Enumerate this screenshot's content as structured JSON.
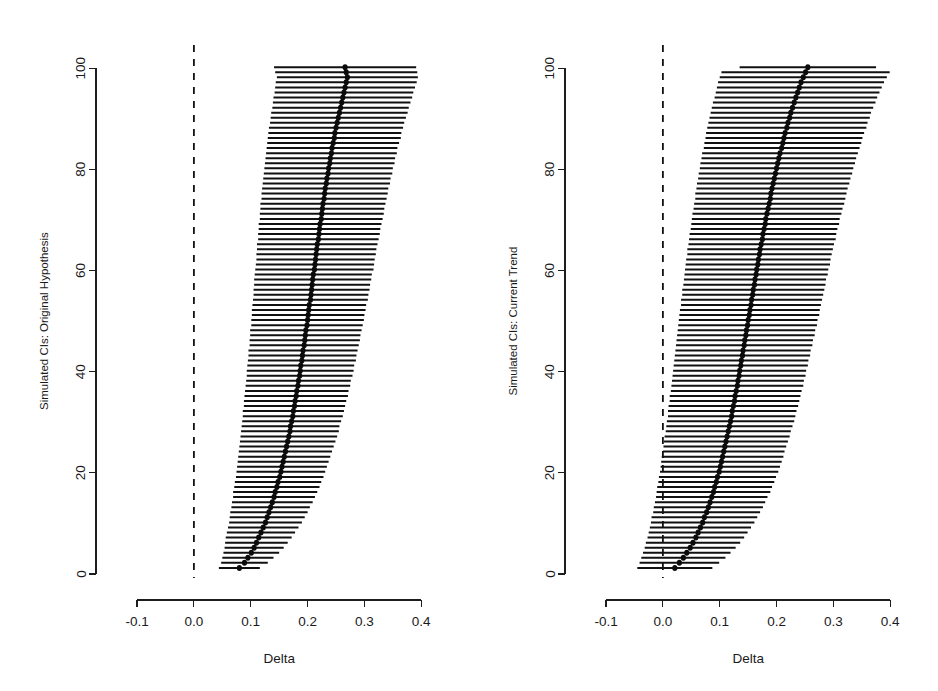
{
  "figure": {
    "background": "#ffffff",
    "ink": "#111111",
    "width": 938,
    "height": 691
  },
  "chart_data": [
    {
      "type": "line",
      "subtype": "forest-plot-simulated-confidence-intervals",
      "panel": "left",
      "title": "",
      "xlabel": "Delta",
      "ylabel": "Simulated CIs: Original Hypothesis",
      "xlim": [
        -0.13,
        0.44
      ],
      "ylim": [
        0,
        103
      ],
      "xticks": [
        -0.1,
        0.0,
        0.1,
        0.2,
        0.3,
        0.4
      ],
      "xticklabels": [
        "-0.1",
        "0.0",
        "0.1",
        "0.2",
        "0.3",
        "0.4"
      ],
      "yticks": [
        0,
        20,
        40,
        60,
        80,
        100
      ],
      "yticklabels": [
        "0",
        "20",
        "40",
        "60",
        "80",
        "100"
      ],
      "grid": false,
      "legend": null,
      "reference_line": {
        "x": 0.0,
        "style": "dashed",
        "color": "#111111"
      },
      "n_intervals": 100,
      "series": [
        {
          "name": "Simulated CI",
          "estimates": [
            0.08,
            0.089,
            0.095,
            0.101,
            0.106,
            0.11,
            0.114,
            0.118,
            0.122,
            0.126,
            0.129,
            0.132,
            0.135,
            0.138,
            0.141,
            0.143,
            0.146,
            0.148,
            0.151,
            0.153,
            0.155,
            0.157,
            0.159,
            0.161,
            0.163,
            0.165,
            0.167,
            0.169,
            0.17,
            0.172,
            0.174,
            0.175,
            0.177,
            0.178,
            0.18,
            0.181,
            0.183,
            0.184,
            0.186,
            0.187,
            0.188,
            0.19,
            0.191,
            0.192,
            0.194,
            0.195,
            0.196,
            0.197,
            0.199,
            0.2,
            0.201,
            0.202,
            0.203,
            0.205,
            0.206,
            0.207,
            0.208,
            0.209,
            0.21,
            0.212,
            0.213,
            0.214,
            0.215,
            0.216,
            0.217,
            0.219,
            0.22,
            0.221,
            0.222,
            0.224,
            0.225,
            0.226,
            0.227,
            0.229,
            0.23,
            0.231,
            0.233,
            0.234,
            0.236,
            0.237,
            0.239,
            0.24,
            0.242,
            0.243,
            0.245,
            0.247,
            0.248,
            0.25,
            0.252,
            0.254,
            0.256,
            0.258,
            0.26,
            0.262,
            0.264,
            0.266,
            0.268,
            0.27,
            0.268,
            0.266
          ],
          "half_widths": [
            0.036,
            0.041,
            0.045,
            0.049,
            0.052,
            0.055,
            0.058,
            0.06,
            0.062,
            0.064,
            0.066,
            0.068,
            0.069,
            0.071,
            0.072,
            0.074,
            0.075,
            0.076,
            0.077,
            0.078,
            0.079,
            0.08,
            0.081,
            0.082,
            0.083,
            0.084,
            0.085,
            0.086,
            0.086,
            0.087,
            0.088,
            0.089,
            0.089,
            0.09,
            0.091,
            0.091,
            0.092,
            0.092,
            0.093,
            0.094,
            0.094,
            0.095,
            0.095,
            0.096,
            0.096,
            0.097,
            0.097,
            0.098,
            0.098,
            0.099,
            0.099,
            0.1,
            0.1,
            0.101,
            0.101,
            0.102,
            0.102,
            0.103,
            0.103,
            0.104,
            0.104,
            0.104,
            0.105,
            0.105,
            0.106,
            0.106,
            0.107,
            0.107,
            0.108,
            0.108,
            0.109,
            0.109,
            0.11,
            0.11,
            0.111,
            0.111,
            0.112,
            0.112,
            0.113,
            0.113,
            0.114,
            0.114,
            0.115,
            0.115,
            0.116,
            0.117,
            0.117,
            0.118,
            0.118,
            0.119,
            0.12,
            0.12,
            0.121,
            0.122,
            0.122,
            0.123,
            0.124,
            0.124,
            0.125,
            0.125
          ]
        }
      ]
    },
    {
      "type": "line",
      "subtype": "forest-plot-simulated-confidence-intervals",
      "panel": "right",
      "title": "",
      "xlabel": "Delta",
      "ylabel": "Simulated CIs: Current Trend",
      "xlim": [
        -0.13,
        0.44
      ],
      "ylim": [
        0,
        103
      ],
      "xticks": [
        -0.1,
        0.0,
        0.1,
        0.2,
        0.3,
        0.4
      ],
      "xticklabels": [
        "-0.1",
        "0.0",
        "0.1",
        "0.2",
        "0.3",
        "0.4"
      ],
      "yticks": [
        0,
        20,
        40,
        60,
        80,
        100
      ],
      "yticklabels": [
        "0",
        "20",
        "40",
        "60",
        "80",
        "100"
      ],
      "grid": false,
      "legend": null,
      "reference_line": {
        "x": 0.0,
        "style": "dashed",
        "color": "#111111"
      },
      "n_intervals": 100,
      "series": [
        {
          "name": "Simulated CI",
          "estimates": [
            0.021,
            0.029,
            0.036,
            0.042,
            0.048,
            0.053,
            0.058,
            0.062,
            0.066,
            0.07,
            0.073,
            0.077,
            0.08,
            0.083,
            0.086,
            0.089,
            0.091,
            0.094,
            0.096,
            0.099,
            0.101,
            0.103,
            0.105,
            0.107,
            0.109,
            0.111,
            0.113,
            0.115,
            0.117,
            0.119,
            0.121,
            0.122,
            0.124,
            0.126,
            0.127,
            0.129,
            0.131,
            0.132,
            0.134,
            0.135,
            0.137,
            0.138,
            0.14,
            0.141,
            0.143,
            0.144,
            0.146,
            0.147,
            0.149,
            0.15,
            0.152,
            0.153,
            0.155,
            0.156,
            0.158,
            0.159,
            0.161,
            0.162,
            0.164,
            0.165,
            0.167,
            0.168,
            0.17,
            0.171,
            0.173,
            0.175,
            0.176,
            0.178,
            0.18,
            0.181,
            0.183,
            0.185,
            0.187,
            0.189,
            0.19,
            0.192,
            0.194,
            0.196,
            0.198,
            0.2,
            0.202,
            0.204,
            0.206,
            0.209,
            0.211,
            0.213,
            0.215,
            0.218,
            0.22,
            0.223,
            0.225,
            0.228,
            0.231,
            0.234,
            0.237,
            0.24,
            0.243,
            0.247,
            0.251,
            0.255
          ],
          "half_widths": [
            0.066,
            0.07,
            0.074,
            0.077,
            0.08,
            0.083,
            0.085,
            0.087,
            0.089,
            0.091,
            0.093,
            0.094,
            0.096,
            0.097,
            0.098,
            0.1,
            0.101,
            0.102,
            0.103,
            0.104,
            0.105,
            0.106,
            0.107,
            0.107,
            0.108,
            0.109,
            0.11,
            0.11,
            0.111,
            0.112,
            0.112,
            0.113,
            0.114,
            0.114,
            0.115,
            0.115,
            0.116,
            0.116,
            0.117,
            0.117,
            0.118,
            0.118,
            0.119,
            0.119,
            0.12,
            0.12,
            0.121,
            0.121,
            0.122,
            0.122,
            0.123,
            0.123,
            0.123,
            0.124,
            0.124,
            0.125,
            0.125,
            0.125,
            0.126,
            0.126,
            0.127,
            0.127,
            0.127,
            0.128,
            0.128,
            0.129,
            0.129,
            0.129,
            0.13,
            0.13,
            0.131,
            0.131,
            0.132,
            0.132,
            0.133,
            0.133,
            0.134,
            0.134,
            0.135,
            0.135,
            0.136,
            0.136,
            0.137,
            0.137,
            0.138,
            0.138,
            0.139,
            0.14,
            0.14,
            0.141,
            0.141,
            0.142,
            0.143,
            0.143,
            0.144,
            0.145,
            0.146,
            0.147,
            0.148,
            0.12
          ]
        }
      ]
    }
  ]
}
